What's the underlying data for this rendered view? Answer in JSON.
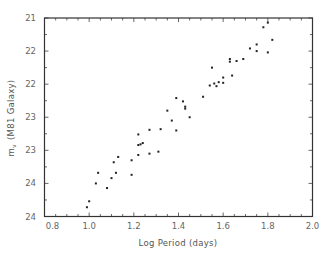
{
  "chart_data": {
    "type": "scatter",
    "title": "",
    "xlabel": "Log Period (days)",
    "ylabel": "m_v (M81 Galaxy)",
    "ylabel_main": "m",
    "ylabel_sub": "v",
    "ylabel_rest": " (M81 Galaxy)",
    "xlim": [
      0.8,
      2.0
    ],
    "ylim": [
      24,
      21
    ],
    "y_inverted": true,
    "grid": false,
    "legend": null,
    "x_ticks": [
      0.8,
      1.0,
      1.2,
      1.4,
      1.6,
      1.8,
      2.0
    ],
    "x_tick_labels": [
      "0.8",
      "1.0",
      "1.2",
      "1.4",
      "1.6",
      "1.8",
      "2.0"
    ],
    "y_ticks": [
      21,
      21.5,
      22,
      22.5,
      23,
      23.5,
      24
    ],
    "y_tick_labels": [
      "21",
      "22",
      "22",
      "23",
      "23",
      "24",
      "24"
    ],
    "series": [
      {
        "name": "Cepheids",
        "marker": "dot",
        "x": [
          0.99,
          1.0,
          1.03,
          1.04,
          1.08,
          1.1,
          1.11,
          1.12,
          1.13,
          1.19,
          1.19,
          1.22,
          1.22,
          1.22,
          1.23,
          1.24,
          1.27,
          1.31,
          1.27,
          1.32,
          1.35,
          1.37,
          1.39,
          1.39,
          1.42,
          1.43,
          1.43,
          1.45,
          1.51,
          1.54,
          1.55,
          1.56,
          1.57,
          1.58,
          1.6,
          1.6,
          1.64,
          1.63,
          1.63,
          1.66,
          1.69,
          1.72,
          1.75,
          1.75,
          1.8,
          1.82,
          1.78,
          1.8
        ],
        "y": [
          23.86,
          23.77,
          23.5,
          23.34,
          23.57,
          23.42,
          23.18,
          23.34,
          23.1,
          23.15,
          23.37,
          22.92,
          23.07,
          22.76,
          22.91,
          22.89,
          23.05,
          23.02,
          22.69,
          22.68,
          22.4,
          22.55,
          22.7,
          22.21,
          22.26,
          22.34,
          22.37,
          22.5,
          22.19,
          22.02,
          21.75,
          21.99,
          22.03,
          21.97,
          21.98,
          21.9,
          21.87,
          21.62,
          21.66,
          21.65,
          21.62,
          21.46,
          21.4,
          21.5,
          21.52,
          21.33,
          21.14,
          21.07
        ]
      }
    ]
  },
  "axes": {
    "x_title": "Log Period (days)",
    "y_title_main": "m",
    "y_title_sub": "v",
    "y_title_rest": "(M81 Galaxy)"
  }
}
